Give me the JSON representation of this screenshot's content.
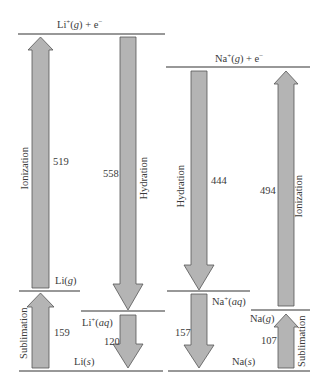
{
  "diagram": {
    "type": "energy-cycle",
    "colors": {
      "arrow_fill": "#b4b4b4",
      "arrow_stroke": "#555555",
      "line": "#333333"
    },
    "lithium": {
      "top_state": {
        "base": "Li",
        "sup": "+",
        "phase": "g",
        "suffix": " + e",
        "suffix_sup": "−"
      },
      "gas_state": {
        "base": "Li",
        "phase": "g"
      },
      "aq_state": {
        "base": "Li",
        "sup": "+",
        "phase": "aq"
      },
      "solid_state": {
        "base": "Li",
        "phase": "s"
      },
      "steps": [
        {
          "name": "Ionization",
          "value": "519",
          "direction": "up"
        },
        {
          "name": "Hydration",
          "value": "558",
          "direction": "down"
        },
        {
          "name": "Sublimation",
          "value": "159",
          "direction": "up"
        },
        {
          "name": "",
          "value": "120",
          "direction": "down"
        }
      ]
    },
    "sodium": {
      "top_state": {
        "base": "Na",
        "sup": "+",
        "phase": "g",
        "suffix": " + e",
        "suffix_sup": "−"
      },
      "gas_state": {
        "base": "Na",
        "phase": "g"
      },
      "aq_state": {
        "base": "Na",
        "sup": "+",
        "phase": "aq"
      },
      "solid_state": {
        "base": "Na",
        "phase": "s"
      },
      "steps": [
        {
          "name": "Hydration",
          "value": "444",
          "direction": "down"
        },
        {
          "name": "Ionization",
          "value": "494",
          "direction": "up"
        },
        {
          "name": "Sublimation",
          "value": "107",
          "direction": "up"
        },
        {
          "name": "",
          "value": "157",
          "direction": "down"
        }
      ]
    }
  }
}
